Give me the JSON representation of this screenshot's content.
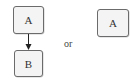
{
  "diagram": {
    "left": {
      "top_node": {
        "label": "A"
      },
      "bottom_node": {
        "label": "B"
      },
      "edge": {
        "from": "A",
        "to": "B",
        "style": "arrow"
      }
    },
    "separator": {
      "label": "or"
    },
    "right": {
      "node": {
        "label": "A"
      }
    }
  }
}
